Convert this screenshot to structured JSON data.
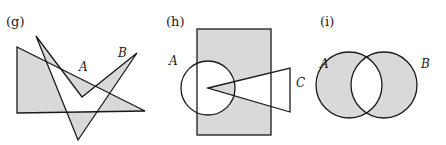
{
  "panels": [
    {
      "id": "g",
      "label": "(g)",
      "set_labels": {
        "A": "A",
        "B": "B"
      },
      "description": "Shaded triangle A overlapping zigzag polygon B; symmetric difference shaded"
    },
    {
      "id": "h",
      "label": "(h)",
      "set_labels": {
        "A": "A",
        "C": "C"
      },
      "description": "Shaded rectangle with circle A and triangle C; rectangle minus circle and triangle shaded plus the wedge shared by A and C"
    },
    {
      "id": "i",
      "label": "(i)",
      "set_labels": {
        "A": "A",
        "B": "B"
      },
      "description": "Two overlapping circles A and B; symmetric difference shaded"
    }
  ],
  "colors": {
    "shade": "#d9d9d9",
    "stroke": "#1a1a1a",
    "background": "#ffffff"
  }
}
